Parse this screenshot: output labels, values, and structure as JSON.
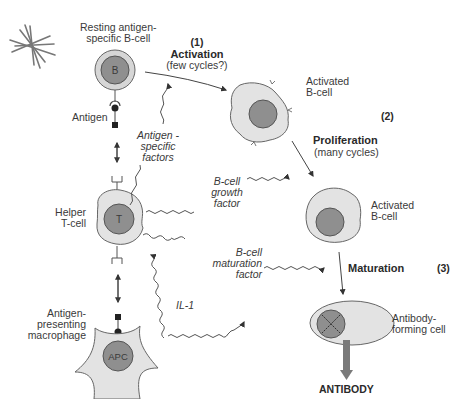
{
  "colors": {
    "cytoplasm": "#e3e3e3",
    "nucleus": "#8f8f8f",
    "outline": "#555555",
    "resting_outer": "#d8d8d8",
    "arrow": "#444444",
    "antibody_arrow": "#7a7a7a"
  },
  "labels": {
    "resting_bcell": [
      "Resting antigen-",
      "specific B-cell"
    ],
    "b_nucleus": "B",
    "antigen": "Antigen",
    "antigen_specific_factors": [
      "Antigen -",
      "specific",
      "factors"
    ],
    "helper_tcell": [
      "Helper",
      "T-cell"
    ],
    "t_nucleus": "T",
    "apc_label": [
      "Antigen-",
      "presenting",
      "macrophage"
    ],
    "apc_nucleus": "APC",
    "step1_num": "(1)",
    "step1_title": "Activation",
    "step1_sub": "(few cycles?)",
    "activated_bcell_1": [
      "Activated",
      "B-cell"
    ],
    "step2_num": "(2)",
    "step2_title": "Proliferation",
    "step2_sub": "(many cycles)",
    "bcell_growth_factor": [
      "B-cell",
      "growth",
      "factor"
    ],
    "activated_bcell_2": [
      "Activated",
      "B-cell"
    ],
    "bcell_maturation_factor": [
      "B-cell",
      "maturation",
      "factor"
    ],
    "step3_title": "Maturation",
    "step3_num": "(3)",
    "il1": "IL-1",
    "antibody_forming_cell": [
      "Antibody-",
      "forming cell"
    ],
    "antibody": "ANTIBODY"
  },
  "icons": {
    "corner": "asterisk-logo-icon"
  }
}
